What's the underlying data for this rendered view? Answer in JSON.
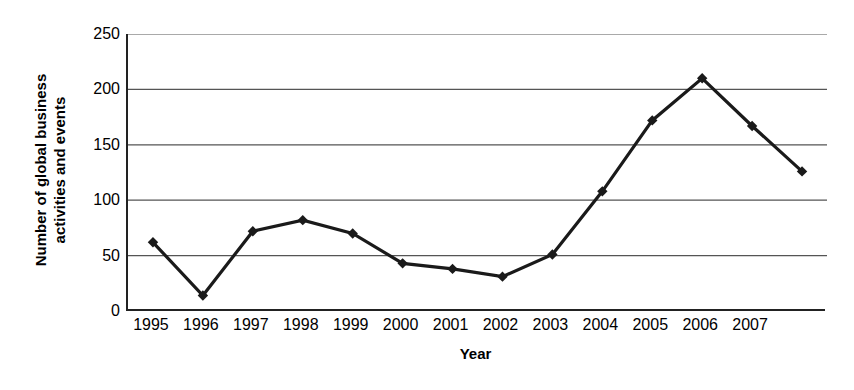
{
  "chart_data": {
    "type": "line",
    "title": "",
    "subtitle": "",
    "xlabel": "Year",
    "ylabel": "Number of global business activities and events",
    "ylabel_lines": [
      "Number of global business",
      "activities and events"
    ],
    "categories": [
      "1995",
      "1996",
      "1997",
      "1998",
      "1999",
      "2000",
      "2001",
      "2002",
      "2003",
      "2004",
      "2005",
      "2006",
      "2007",
      ""
    ],
    "x_tick_labels": [
      "1995",
      "1996",
      "1997",
      "1998",
      "1999",
      "2000",
      "2001",
      "2002",
      "2003",
      "2004",
      "2005",
      "2006",
      "2007"
    ],
    "values": [
      62,
      14,
      72,
      82,
      70,
      43,
      38,
      31,
      51,
      108,
      172,
      210,
      167,
      126
    ],
    "series": [
      {
        "name": "Global business activities and events",
        "values": [
          62,
          14,
          72,
          82,
          70,
          43,
          38,
          31,
          51,
          108,
          172,
          210,
          167,
          126
        ]
      }
    ],
    "ylim": [
      0,
      250
    ],
    "y_ticks": [
      0,
      50,
      100,
      150,
      200,
      250
    ],
    "y_tick_labels": [
      "0",
      "50",
      "100",
      "150",
      "200",
      "250"
    ],
    "grid": "horizontal",
    "legend": "none",
    "marker": "diamond",
    "line_color": "#1a1a1a",
    "marker_color": "#1a1a1a",
    "grid_color": "#555555",
    "axis_color": "#222222",
    "background": "#ffffff",
    "annotations": []
  }
}
